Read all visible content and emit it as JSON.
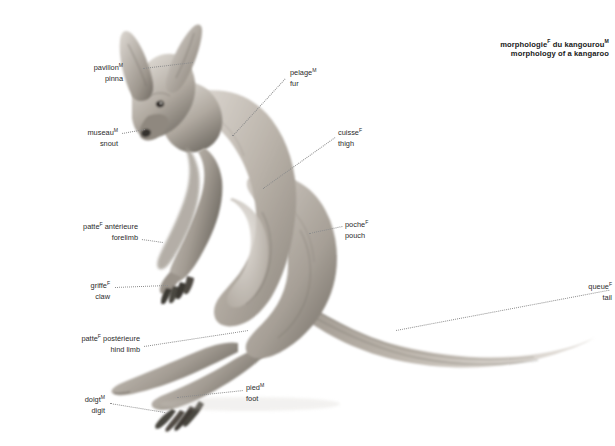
{
  "title": {
    "line_fr": "morphologie",
    "line_fr_gender": "F",
    "line_fr_rest": " du kangourou",
    "line_fr_rest_gender": "M",
    "line_en": "morphology of a kangaroo"
  },
  "subject": "kangaroo",
  "labels": [
    {
      "id": "pinna",
      "fr": "pavillon",
      "fr_gender": "M",
      "en": "pinna",
      "align": "right",
      "x": 61,
      "y": 62,
      "line": {
        "x1": 143,
        "y1": 68,
        "x2": 193,
        "y2": 62
      }
    },
    {
      "id": "snout",
      "fr": "museau",
      "fr_gender": "M",
      "en": "snout",
      "align": "right",
      "x": 53,
      "y": 127,
      "line": {
        "x1": 122,
        "y1": 133,
        "x2": 145,
        "y2": 129
      }
    },
    {
      "id": "forelimb",
      "fr": "patte",
      "fr_gender": "F",
      "fr_rest": " antérieure",
      "en": "forelimb",
      "align": "right",
      "x": 26,
      "y": 221,
      "line": {
        "x1": 142,
        "y1": 239,
        "x2": 163,
        "y2": 242
      }
    },
    {
      "id": "claw",
      "fr": "griffe",
      "fr_gender": "F",
      "en": "claw",
      "align": "right",
      "x": 71,
      "y": 280,
      "line": {
        "x1": 115,
        "y1": 287,
        "x2": 168,
        "y2": 285
      }
    },
    {
      "id": "hind-limb",
      "fr": "patte",
      "fr_gender": "F",
      "fr_rest": " postérieure",
      "en": "hind limb",
      "align": "right",
      "x": 27,
      "y": 333,
      "line": {
        "x1": 144,
        "y1": 346,
        "x2": 248,
        "y2": 330
      }
    },
    {
      "id": "digit",
      "fr": "doigt",
      "fr_gender": "M",
      "en": "digit",
      "align": "right",
      "x": 69,
      "y": 394,
      "line": {
        "x1": 110,
        "y1": 403,
        "x2": 165,
        "y2": 412
      }
    },
    {
      "id": "fur",
      "fr": "pelage",
      "fr_gender": "M",
      "en": "fur",
      "align": "left",
      "x": 290,
      "y": 67,
      "line": {
        "x1": 232,
        "y1": 136,
        "x2": 287,
        "y2": 76
      }
    },
    {
      "id": "thigh",
      "fr": "cuisse",
      "fr_gender": "F",
      "en": "thigh",
      "align": "left",
      "x": 338,
      "y": 127,
      "line": {
        "x1": 263,
        "y1": 188,
        "x2": 335,
        "y2": 137
      }
    },
    {
      "id": "pouch",
      "fr": "poche",
      "fr_gender": "F",
      "en": "pouch",
      "align": "left",
      "x": 345,
      "y": 219,
      "line": {
        "x1": 309,
        "y1": 233,
        "x2": 342,
        "y2": 226
      }
    },
    {
      "id": "tail",
      "fr": "queue",
      "fr_gender": "F",
      "en": "tail",
      "align": "left",
      "x": 612,
      "y": 281,
      "line": {
        "x1": 396,
        "y1": 330,
        "x2": 609,
        "y2": 290
      }
    },
    {
      "id": "foot",
      "fr": "pied",
      "fr_gender": "M",
      "en": "foot",
      "align": "left",
      "x": 246,
      "y": 382,
      "line": {
        "x1": 177,
        "y1": 397,
        "x2": 243,
        "y2": 390
      }
    }
  ],
  "colors": {
    "text": "#2b2b2b",
    "title": "#1a1a1a",
    "leader": "#8d8d8d",
    "background": "#ffffff",
    "fur_light": "#d9d5d0",
    "fur_mid": "#b4ada5",
    "fur_dark": "#8a837b",
    "fur_shadow": "#5e5952"
  }
}
